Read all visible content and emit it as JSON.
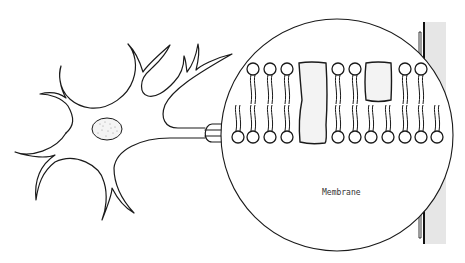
{
  "diagram": {
    "labels": {
      "membrane": "Membrane"
    },
    "parts": [
      {
        "id": "neuron",
        "name": "Neuron cell body with dendrites"
      },
      {
        "id": "nucleus",
        "name": "Nucleus (stippled oval)"
      },
      {
        "id": "axon",
        "name": "Axon"
      },
      {
        "id": "magnifier",
        "name": "Magnification circle"
      },
      {
        "id": "lipid-bilayer",
        "name": "Phospholipid bilayer"
      },
      {
        "id": "protein-large",
        "name": "Transmembrane protein (spanning)"
      },
      {
        "id": "protein-small",
        "name": "Peripheral protein (upper leaflet)"
      },
      {
        "id": "side-panel",
        "name": "Grey vertical bar at right edge"
      }
    ],
    "bilayer": {
      "upper_heads": 9,
      "lower_heads": 11
    },
    "colors": {
      "ink": "#1a1a1a",
      "protein_fill": "#f3f3f3",
      "side_panel": "#e4e4e4",
      "nucleus_fill": "#f4f4f4"
    }
  }
}
